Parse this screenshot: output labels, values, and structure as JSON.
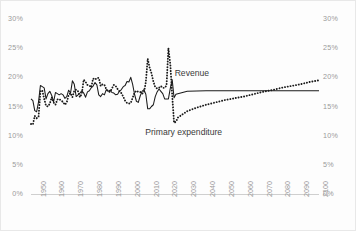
{
  "chart_data": {
    "type": "line",
    "title": "",
    "subtitle": "",
    "xlabel": "",
    "ylabel": "",
    "xlim": [
      1947,
      2100
    ],
    "ylim": [
      0,
      30
    ],
    "grid": false,
    "legend_position": "inline-annotation",
    "y_tick_labels": [
      "30%",
      "25%",
      "20%",
      "15%",
      "10%",
      "5%",
      "0%"
    ],
    "y_tick_values": [
      30,
      25,
      20,
      15,
      10,
      5,
      0
    ],
    "y_axis_left": true,
    "y_axis_right": true,
    "x_tick_labels": [
      "1950",
      "1960",
      "1970",
      "1980",
      "1990",
      "2000",
      "2010",
      "2020",
      "2030",
      "2040",
      "2050",
      "2060",
      "2070",
      "2080",
      "2090",
      "2100"
    ],
    "x_tick_values": [
      1950,
      1960,
      1970,
      1980,
      1990,
      2000,
      2010,
      2020,
      2030,
      2040,
      2050,
      2060,
      2070,
      2080,
      2090,
      2100
    ],
    "annotations": [
      {
        "text": "Revenue",
        "x": 2035,
        "y": 21.5
      },
      {
        "text": "Primary expenditure",
        "x": 2030,
        "y": 11.3
      }
    ],
    "series": [
      {
        "name": "Revenue",
        "style": "solid",
        "color": "#1a1a1a",
        "x": [
          1947,
          1948,
          1949,
          1950,
          1951,
          1952,
          1953,
          1954,
          1955,
          1956,
          1957,
          1958,
          1959,
          1960,
          1961,
          1962,
          1963,
          1964,
          1965,
          1966,
          1967,
          1968,
          1969,
          1970,
          1971,
          1972,
          1973,
          1974,
          1975,
          1976,
          1977,
          1978,
          1979,
          1980,
          1981,
          1982,
          1983,
          1984,
          1985,
          1986,
          1987,
          1988,
          1989,
          1990,
          1991,
          1992,
          1993,
          1994,
          1995,
          1996,
          1997,
          1998,
          1999,
          2000,
          2001,
          2002,
          2003,
          2004,
          2005,
          2006,
          2007,
          2008,
          2009,
          2010,
          2011,
          2012,
          2013,
          2014,
          2015,
          2016,
          2017,
          2018,
          2019,
          2020,
          2021,
          2022,
          2023,
          2024,
          2030,
          2040,
          2050,
          2060,
          2070,
          2080,
          2090,
          2100
        ],
        "values": [
          16.3,
          16.0,
          14.3,
          14.1,
          15.8,
          18.6,
          18.4,
          18.2,
          16.3,
          17.2,
          17.6,
          16.9,
          15.8,
          17.4,
          17.2,
          17.0,
          17.2,
          17.0,
          16.4,
          16.7,
          17.8,
          17.3,
          19.4,
          18.8,
          16.7,
          17.0,
          17.3,
          17.7,
          17.3,
          16.6,
          17.5,
          17.7,
          18.2,
          18.5,
          19.1,
          18.7,
          17.0,
          16.7,
          17.2,
          17.0,
          17.9,
          17.6,
          17.8,
          17.4,
          17.3,
          17.0,
          17.1,
          17.6,
          17.9,
          18.4,
          18.6,
          19.3,
          19.2,
          20.0,
          18.8,
          17.1,
          15.9,
          15.7,
          16.8,
          17.6,
          17.9,
          17.1,
          14.6,
          14.6,
          15.0,
          15.3,
          16.7,
          17.5,
          18.0,
          17.6,
          17.2,
          16.3,
          16.3,
          16.3,
          18.1,
          19.6,
          16.5,
          17.1,
          17.6,
          17.7,
          17.7,
          17.7,
          17.7,
          17.7,
          17.7,
          17.7
        ]
      },
      {
        "name": "Primary expenditure",
        "style": "dotted",
        "color": "#1a1a1a",
        "x": [
          1947,
          1948,
          1949,
          1950,
          1951,
          1952,
          1953,
          1954,
          1955,
          1956,
          1957,
          1958,
          1959,
          1960,
          1961,
          1962,
          1963,
          1964,
          1965,
          1966,
          1967,
          1968,
          1969,
          1970,
          1971,
          1972,
          1973,
          1974,
          1975,
          1976,
          1977,
          1978,
          1979,
          1980,
          1981,
          1982,
          1983,
          1984,
          1985,
          1986,
          1987,
          1988,
          1989,
          1990,
          1991,
          1992,
          1993,
          1994,
          1995,
          1996,
          1997,
          1998,
          1999,
          2000,
          2001,
          2002,
          2003,
          2004,
          2005,
          2006,
          2007,
          2008,
          2009,
          2010,
          2011,
          2012,
          2013,
          2014,
          2015,
          2016,
          2017,
          2018,
          2019,
          2020,
          2021,
          2022,
          2023,
          2024,
          2025,
          2030,
          2035,
          2040,
          2045,
          2050,
          2055,
          2060,
          2065,
          2070,
          2075,
          2080,
          2085,
          2090,
          2095,
          2100
        ],
        "values": [
          12.0,
          11.9,
          13.4,
          13.0,
          13.2,
          17.6,
          17.8,
          16.3,
          15.1,
          15.0,
          15.5,
          16.6,
          15.7,
          15.3,
          16.2,
          16.3,
          16.0,
          15.8,
          15.3,
          15.7,
          17.0,
          17.3,
          16.6,
          17.7,
          17.9,
          17.6,
          16.6,
          17.2,
          19.6,
          19.2,
          18.7,
          18.6,
          18.3,
          19.8,
          19.6,
          19.9,
          19.9,
          18.5,
          18.8,
          18.7,
          18.0,
          17.6,
          17.5,
          18.1,
          18.7,
          18.5,
          18.0,
          17.6,
          17.3,
          16.7,
          16.0,
          15.6,
          15.5,
          15.6,
          16.5,
          17.4,
          17.7,
          17.5,
          17.5,
          17.2,
          17.4,
          19.2,
          23.2,
          21.7,
          20.7,
          19.3,
          18.3,
          18.1,
          18.2,
          18.5,
          18.2,
          18.2,
          18.6,
          25.0,
          22.3,
          17.0,
          12.2,
          12.4,
          13.1,
          14.2,
          14.8,
          15.3,
          15.7,
          16.1,
          16.4,
          16.7,
          17.1,
          17.5,
          17.8,
          18.2,
          18.5,
          18.8,
          19.2,
          19.5
        ]
      }
    ]
  },
  "annotations": {
    "revenue_label": "Revenue",
    "expenditure_label": "Primary expenditure"
  },
  "colors": {
    "background": "#fdfdfd",
    "axis_text": "#9a9a9a",
    "series": "#1a1a1a",
    "baseline": "#cfcfcf",
    "border": "#e8e8e8"
  }
}
